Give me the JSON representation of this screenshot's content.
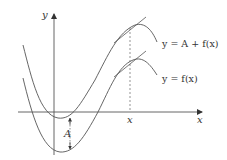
{
  "diagram": {
    "title": "",
    "axes": {
      "x_label": "x",
      "y_label": "y",
      "x_marker_label": "x"
    },
    "curves": [
      {
        "id": "shifted",
        "label": "y = A + f(x)"
      },
      {
        "id": "original",
        "label": "y = f(x)"
      }
    ],
    "shift_label": "A",
    "colors": {
      "line": "#555555",
      "text": "#333333",
      "background": "#ffffff"
    }
  }
}
